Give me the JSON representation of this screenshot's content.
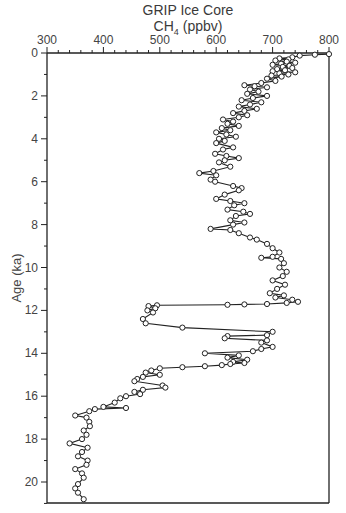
{
  "chart_data": {
    "type": "line",
    "title": "GRIP Ice Core",
    "subtitle_main": "CH",
    "subtitle_sub": "4",
    "subtitle_unit": " (ppbv)",
    "xlabel": "CH4 (ppbv)",
    "ylabel": "Age (ka)",
    "xlim": [
      300,
      800
    ],
    "ylim": [
      21,
      0
    ],
    "x_axis_position": "top",
    "y_inverted": true,
    "grid": false,
    "legend": null,
    "x_ticks": [
      "300",
      "400",
      "500",
      "600",
      "700",
      "800"
    ],
    "y_ticks": [
      "0",
      "2",
      "4",
      "6",
      "8",
      "10",
      "12",
      "14",
      "16",
      "18",
      "20"
    ],
    "marker": "open-circle",
    "series": [
      {
        "name": "GRIP CH4",
        "points": [
          [
            0.05,
            800
          ],
          [
            0.08,
            775
          ],
          [
            0.12,
            748
          ],
          [
            0.2,
            735
          ],
          [
            0.25,
            712
          ],
          [
            0.3,
            728
          ],
          [
            0.35,
            705
          ],
          [
            0.4,
            725
          ],
          [
            0.45,
            740
          ],
          [
            0.5,
            715
          ],
          [
            0.55,
            700
          ],
          [
            0.6,
            730
          ],
          [
            0.65,
            718
          ],
          [
            0.7,
            735
          ],
          [
            0.75,
            708
          ],
          [
            0.8,
            722
          ],
          [
            0.85,
            700
          ],
          [
            0.9,
            740
          ],
          [
            0.95,
            712
          ],
          [
            1.0,
            728
          ],
          [
            1.05,
            698
          ],
          [
            1.1,
            716
          ],
          [
            1.2,
            690
          ],
          [
            1.3,
            705
          ],
          [
            1.4,
            680
          ],
          [
            1.5,
            650
          ],
          [
            1.55,
            668
          ],
          [
            1.6,
            690
          ],
          [
            1.7,
            660
          ],
          [
            1.8,
            675
          ],
          [
            1.9,
            655
          ],
          [
            2.0,
            690
          ],
          [
            2.1,
            665
          ],
          [
            2.2,
            645
          ],
          [
            2.3,
            680
          ],
          [
            2.4,
            660
          ],
          [
            2.5,
            640
          ],
          [
            2.6,
            672
          ],
          [
            2.7,
            650
          ],
          [
            2.8,
            630
          ],
          [
            2.9,
            655
          ],
          [
            3.0,
            640
          ],
          [
            3.1,
            612
          ],
          [
            3.2,
            630
          ],
          [
            3.3,
            620
          ],
          [
            3.4,
            640
          ],
          [
            3.5,
            610
          ],
          [
            3.6,
            625
          ],
          [
            3.7,
            600
          ],
          [
            3.8,
            618
          ],
          [
            3.9,
            635
          ],
          [
            4.0,
            605
          ],
          [
            4.1,
            615
          ],
          [
            4.2,
            600
          ],
          [
            4.4,
            630
          ],
          [
            4.5,
            612
          ],
          [
            4.7,
            598
          ],
          [
            4.8,
            618
          ],
          [
            4.9,
            640
          ],
          [
            5.0,
            615
          ],
          [
            5.1,
            605
          ],
          [
            5.3,
            625
          ],
          [
            5.5,
            595
          ],
          [
            5.6,
            570
          ],
          [
            5.7,
            600
          ],
          [
            5.9,
            590
          ],
          [
            6.0,
            598
          ],
          [
            6.2,
            630
          ],
          [
            6.3,
            645
          ],
          [
            6.4,
            640
          ],
          [
            6.6,
            615
          ],
          [
            6.8,
            600
          ],
          [
            6.9,
            625
          ],
          [
            7.0,
            650
          ],
          [
            7.1,
            632
          ],
          [
            7.3,
            620
          ],
          [
            7.4,
            648
          ],
          [
            7.5,
            660
          ],
          [
            7.6,
            635
          ],
          [
            7.8,
            625
          ],
          [
            7.9,
            650
          ],
          [
            8.0,
            630
          ],
          [
            8.2,
            590
          ],
          [
            8.25,
            625
          ],
          [
            8.4,
            640
          ],
          [
            8.6,
            660
          ],
          [
            8.7,
            672
          ],
          [
            8.9,
            690
          ],
          [
            9.1,
            700
          ],
          [
            9.3,
            712
          ],
          [
            9.5,
            700
          ],
          [
            9.55,
            680
          ],
          [
            9.6,
            715
          ],
          [
            9.8,
            720
          ],
          [
            10.0,
            712
          ],
          [
            10.2,
            725
          ],
          [
            10.4,
            718
          ],
          [
            10.6,
            700
          ],
          [
            10.8,
            722
          ],
          [
            11.0,
            708
          ],
          [
            11.2,
            695
          ],
          [
            11.3,
            720
          ],
          [
            11.4,
            705
          ],
          [
            11.5,
            735
          ],
          [
            11.6,
            745
          ],
          [
            11.65,
            725
          ],
          [
            11.7,
            690
          ],
          [
            11.72,
            650
          ],
          [
            11.74,
            620
          ],
          [
            11.76,
            495
          ],
          [
            11.8,
            480
          ],
          [
            11.9,
            492
          ],
          [
            12.0,
            478
          ],
          [
            12.1,
            488
          ],
          [
            12.4,
            470
          ],
          [
            12.6,
            475
          ],
          [
            12.8,
            540
          ],
          [
            13.0,
            700
          ],
          [
            13.15,
            690
          ],
          [
            13.2,
            620
          ],
          [
            13.3,
            615
          ],
          [
            13.4,
            690
          ],
          [
            13.5,
            680
          ],
          [
            13.7,
            700
          ],
          [
            13.8,
            680
          ],
          [
            13.9,
            665
          ],
          [
            14.0,
            580
          ],
          [
            14.1,
            640
          ],
          [
            14.2,
            620
          ],
          [
            14.3,
            655
          ],
          [
            14.4,
            630
          ],
          [
            14.45,
            650
          ],
          [
            14.5,
            625
          ],
          [
            14.55,
            610
          ],
          [
            14.6,
            580
          ],
          [
            14.65,
            540
          ],
          [
            14.7,
            500
          ],
          [
            14.8,
            485
          ],
          [
            14.9,
            475
          ],
          [
            15.0,
            500
          ],
          [
            15.1,
            470
          ],
          [
            15.2,
            460
          ],
          [
            15.3,
            455
          ],
          [
            15.5,
            505
          ],
          [
            15.6,
            510
          ],
          [
            15.7,
            470
          ],
          [
            15.8,
            455
          ],
          [
            15.9,
            465
          ],
          [
            16.0,
            440
          ],
          [
            16.1,
            430
          ],
          [
            16.3,
            420
          ],
          [
            16.5,
            400
          ],
          [
            16.55,
            440
          ],
          [
            16.6,
            385
          ],
          [
            16.7,
            375
          ],
          [
            16.9,
            350
          ],
          [
            17.0,
            370
          ],
          [
            17.2,
            375
          ],
          [
            17.4,
            376
          ],
          [
            17.6,
            365
          ],
          [
            17.8,
            370
          ],
          [
            18.0,
            362
          ],
          [
            18.2,
            340
          ],
          [
            18.4,
            372
          ],
          [
            18.6,
            362
          ],
          [
            18.8,
            355
          ],
          [
            19.0,
            372
          ],
          [
            19.2,
            370
          ],
          [
            19.4,
            350
          ],
          [
            19.6,
            362
          ],
          [
            19.8,
            365
          ],
          [
            20.1,
            355
          ],
          [
            20.3,
            350
          ],
          [
            20.5,
            355
          ],
          [
            20.8,
            365
          ]
        ]
      }
    ]
  }
}
